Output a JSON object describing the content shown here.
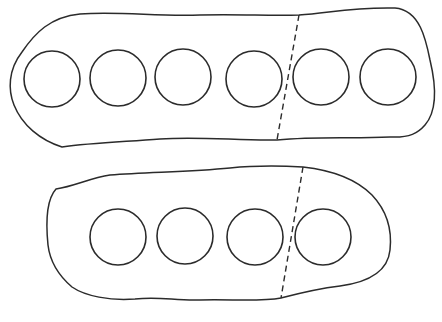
{
  "diagram": {
    "width": 442,
    "height": 322,
    "stroke_color": "#2b2b2b",
    "background": "#ffffff",
    "plates": [
      {
        "name": "top-plate",
        "outline_path": "M 80 14 C 120 11, 160 17, 200 15 C 240 14, 270 16, 299 15 C 330 13, 350 7, 395 8 C 420 10, 426 40, 430 60 C 436 85, 438 110, 425 125 C 418 133, 410 138, 390 137 C 350 139, 320 136, 277 140 C 240 141, 200 136, 160 139 C 120 142, 90 143, 62 147 C 40 140, 22 125, 14 105 C 8 90, 8 70, 22 52 C 35 33, 50 17, 80 14 Z",
        "holes": [
          {
            "cx": 52,
            "cy": 79,
            "r": 28
          },
          {
            "cx": 118,
            "cy": 78,
            "r": 28
          },
          {
            "cx": 183,
            "cy": 77,
            "r": 28
          },
          {
            "cx": 254,
            "cy": 79,
            "r": 28
          },
          {
            "cx": 321,
            "cy": 77,
            "r": 28
          },
          {
            "cx": 388,
            "cy": 77,
            "r": 28
          }
        ],
        "divider": {
          "x1": 299,
          "y1": 15,
          "x2": 277,
          "y2": 140
        }
      },
      {
        "name": "bottom-plate",
        "outline_path": "M 56 189 C 75 186, 90 178, 110 175 C 150 172, 190 172, 230 168 C 260 165, 285 166, 303 167 C 330 170, 355 178, 372 195 C 388 212, 392 232, 390 250 C 388 270, 370 282, 340 286 C 315 289, 300 293, 281 298 C 260 302, 230 299, 200 300 C 175 301, 160 296, 135 299 C 110 301, 85 296, 72 287 C 58 275, 50 262, 48 245 C 46 225, 46 200, 56 189 Z",
        "holes": [
          {
            "cx": 118,
            "cy": 237,
            "r": 28
          },
          {
            "cx": 185,
            "cy": 236,
            "r": 28
          },
          {
            "cx": 255,
            "cy": 237,
            "r": 28
          },
          {
            "cx": 323,
            "cy": 237,
            "r": 28
          }
        ],
        "divider": {
          "x1": 303,
          "y1": 167,
          "x2": 281,
          "y2": 298
        }
      }
    ]
  }
}
